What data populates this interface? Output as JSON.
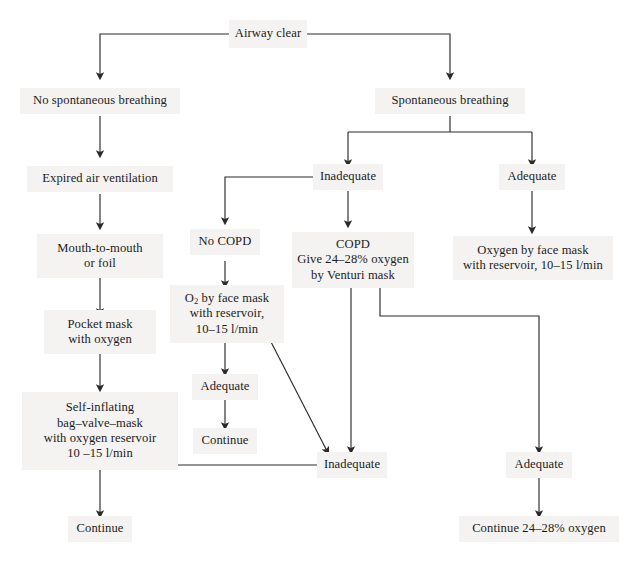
{
  "diagram": {
    "page_bg": "#ffffff",
    "node_bg": "#f4f3f1",
    "line_color": "#2a2a2a",
    "text_color": "#1c1c1c"
  },
  "nodes": {
    "airway_clear": {
      "label": "Airway clear"
    },
    "no_spontaneous_breathing": {
      "label": "No spontaneous breathing"
    },
    "spontaneous_breathing": {
      "label": "Spontaneous breathing"
    },
    "expired_air_ventilation": {
      "label": "Expired air ventilation"
    },
    "inadequate_top": {
      "label": "Inadequate"
    },
    "adequate_top_right": {
      "label": "Adequate"
    },
    "mouth_to_mouth": {
      "line1": "Mouth-to-mouth",
      "line2": "or foil"
    },
    "no_copd": {
      "label": "No COPD"
    },
    "copd": {
      "line1": "COPD",
      "line2": "Give 24–28% oxygen",
      "line3": "by Venturi mask"
    },
    "oxygen_face_mask_right": {
      "line1": "Oxygen by face mask",
      "line2": "with reservoir, 10–15 l/min"
    },
    "pocket_mask": {
      "line1": "Pocket mask",
      "line2": "with oxygen"
    },
    "o2_face_mask_mid": {
      "line1_pre": "O",
      "line1_sub": "2",
      "line1_post": " by face mask",
      "line2": "with reservoir,",
      "line3": "10–15 l/min"
    },
    "adequate_mid": {
      "label": "Adequate"
    },
    "self_inflating": {
      "line1": "Self-inflating",
      "line2": "bag–valve–mask",
      "line3": "with oxygen reservoir",
      "line4": "10 –15 l/min"
    },
    "continue_mid": {
      "label": "Continue"
    },
    "inadequate_bottom": {
      "label": "Inadequate"
    },
    "adequate_bottom_right": {
      "label": "Adequate"
    },
    "continue_left_bottom": {
      "label": "Continue"
    },
    "continue_24_28": {
      "label": "Continue 24–28% oxygen"
    }
  }
}
